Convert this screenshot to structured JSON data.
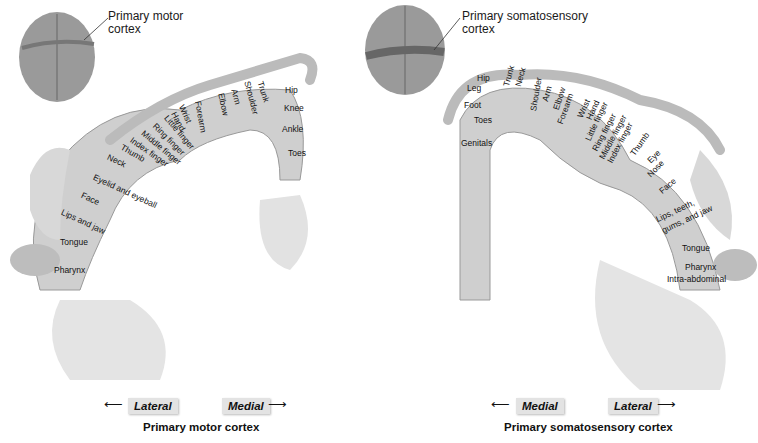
{
  "motor": {
    "callout": [
      "Primary motor",
      "cortex"
    ],
    "segments": [
      "Toes",
      "Ankle",
      "Knee",
      "Hip",
      "Trunk",
      "Shoulder",
      "Arm",
      "Elbow",
      "Forearm",
      "Wrist",
      "Hand",
      "Little finger",
      "Ring finger",
      "Middle finger",
      "Index finger",
      "Thumb",
      "Neck",
      "Eyelid and eyeball",
      "Face",
      "Lips and jaw",
      "Tongue",
      "Pharynx"
    ],
    "direction_left": "Lateral",
    "direction_right": "Medial",
    "title": "Primary motor cortex"
  },
  "sensory": {
    "callout": [
      "Primary somatosensory",
      "cortex"
    ],
    "segments": [
      "Genitals",
      "Toes",
      "Foot",
      "Leg",
      "Hip",
      "Trunk",
      "Neck",
      "Shoulder",
      "Arm",
      "Elbow",
      "Forearm",
      "Wrist",
      "Hand",
      "Little finger",
      "Ring finger",
      "Middle finger",
      "Index finger",
      "Thumb",
      "Eye",
      "Nose",
      "Face",
      "Lips, teeth,",
      "gums, and jaw",
      "Tongue",
      "Pharynx",
      "Intra-abdominal"
    ],
    "direction_left": "Medial",
    "direction_right": "Lateral",
    "title": "Primary somatosensory cortex"
  },
  "arrows": {
    "left": "⟵",
    "right": "⟶"
  }
}
